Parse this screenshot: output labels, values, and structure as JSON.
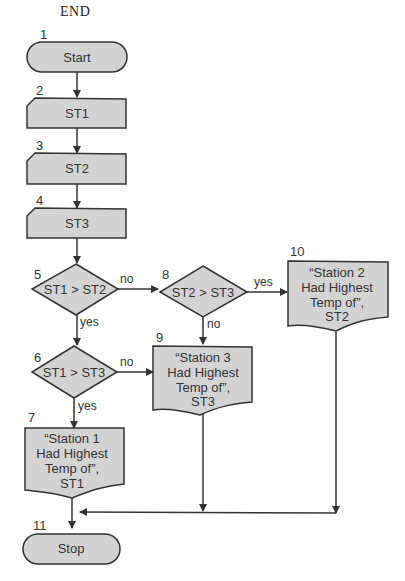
{
  "title": "END",
  "nodes": {
    "n1": {
      "num": "1",
      "label": "Start",
      "type": "terminal"
    },
    "n2": {
      "num": "2",
      "label": "ST1",
      "type": "input"
    },
    "n3": {
      "num": "3",
      "label": "ST2",
      "type": "input"
    },
    "n4": {
      "num": "4",
      "label": "ST3",
      "type": "input"
    },
    "n5": {
      "num": "5",
      "label": "ST1 > ST2",
      "type": "decision"
    },
    "n6": {
      "num": "6",
      "label": "ST1 > ST3",
      "type": "decision"
    },
    "n7": {
      "num": "7",
      "lines": [
        "“Station 1",
        "Had Highest",
        "Temp of”,",
        "ST1"
      ],
      "type": "output"
    },
    "n8": {
      "num": "8",
      "label": "ST2 > ST3",
      "type": "decision"
    },
    "n9": {
      "num": "9",
      "lines": [
        "“Station 3",
        "Had Highest",
        "Temp of”,",
        "ST3"
      ],
      "type": "output"
    },
    "n10": {
      "num": "10",
      "lines": [
        "“Station 2",
        "Had Highest",
        "Temp of”,",
        "ST2"
      ],
      "type": "output"
    },
    "n11": {
      "num": "11",
      "label": "Stop",
      "type": "terminal"
    }
  },
  "edges": {
    "e5_8": "no",
    "e5_6": "yes",
    "e6_9": "no",
    "e6_7": "yes",
    "e8_10": "yes",
    "e8_9": "no"
  },
  "colors": {
    "fill": "#d3d3d3",
    "stroke": "#333333"
  }
}
